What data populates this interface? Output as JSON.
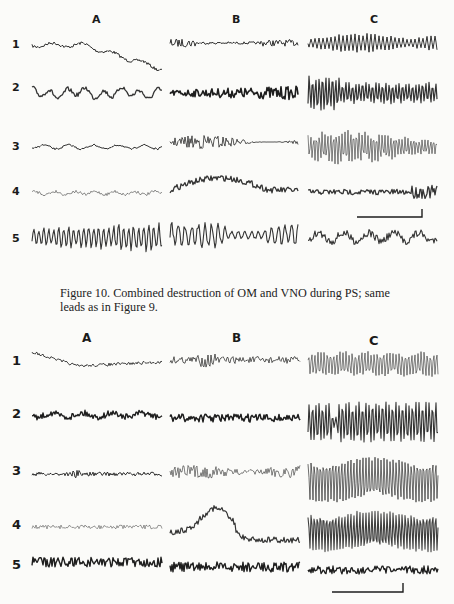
{
  "figure_top": {
    "column_labels": [
      "A",
      "B",
      "C"
    ],
    "row_labels": [
      "1",
      "2",
      "3",
      "4",
      "5"
    ],
    "scale_bar": {
      "x1": 357,
      "x2": 422,
      "y": 217,
      "tick_up": 8
    }
  },
  "caption": {
    "text": "Figure 10. Combined destruction of OM and VNO during PS; same leads as in Figure 9."
  },
  "figure_bottom": {
    "column_labels": [
      "A",
      "B",
      "C"
    ],
    "row_labels": [
      "1",
      "2",
      "3",
      "4",
      "5"
    ],
    "scale_bar": {
      "x1": 332,
      "x2": 403,
      "y": 592,
      "tick_up": 9
    }
  },
  "colors": {
    "ink": "#1e1e1e",
    "paper": "#fbfbf9"
  }
}
